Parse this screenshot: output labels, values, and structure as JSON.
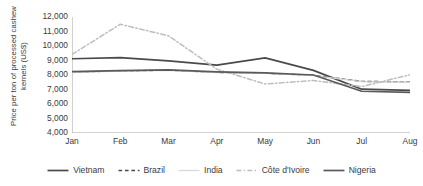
{
  "chart_data": {
    "type": "line",
    "title": "",
    "xlabel": "",
    "ylabel": "Price per ton of processed cashew kernels (US$)",
    "categories": [
      "Jan",
      "Feb",
      "Mar",
      "Apr",
      "May",
      "Jun",
      "Jul",
      "Aug"
    ],
    "ylim": [
      4000,
      12000
    ],
    "yticks": [
      "4,000",
      "5,000",
      "6,000",
      "7,000",
      "8,000",
      "9,000",
      "10,000",
      "11,000",
      "12,000"
    ],
    "ytick_values": [
      4000,
      5000,
      6000,
      7000,
      8000,
      9000,
      10000,
      11000,
      12000
    ],
    "grid": false,
    "legend_position": "bottom",
    "series": [
      {
        "name": "Vietnam",
        "style": "solid",
        "color": "#4a4a4a",
        "width": 1.7,
        "values": [
          9120,
          9200,
          8980,
          8680,
          9180,
          8320,
          7020,
          6940
        ]
      },
      {
        "name": "Brazil",
        "style": "dashed",
        "color": "#4a4a4a",
        "width": 1.4,
        "values": [
          8200,
          8280,
          8330,
          8180,
          8120,
          7980,
          7560,
          7520
        ]
      },
      {
        "name": "India",
        "style": "solid",
        "color": "#d8d8d8",
        "width": 1.3,
        "values": [
          8180,
          8270,
          8320,
          8170,
          8110,
          7960,
          7540,
          7500
        ]
      },
      {
        "name": "Côte d'Ivoire",
        "style": "dashdot",
        "color": "#bdbdbd",
        "width": 1.5,
        "values": [
          9420,
          11500,
          10700,
          8400,
          7380,
          7620,
          7200,
          8020
        ]
      },
      {
        "name": "Nigeria",
        "style": "solid",
        "color": "#5a5a5a",
        "width": 1.7,
        "values": [
          8230,
          8300,
          8360,
          8220,
          8150,
          8000,
          6880,
          6800
        ]
      }
    ]
  },
  "axis": {
    "line_color": "#9a9a9a",
    "tick_color": "#9a9a9a"
  }
}
